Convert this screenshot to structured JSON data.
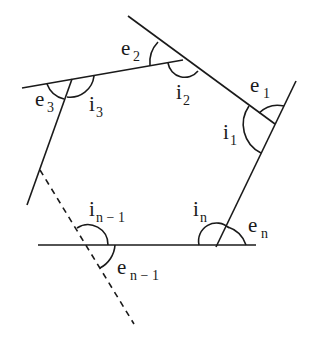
{
  "diagram": {
    "stroke_color": "#1a1a1a",
    "background": "#ffffff",
    "labels": {
      "e1": {
        "base": "e",
        "sub": "1"
      },
      "e2": {
        "base": "e",
        "sub": "2"
      },
      "e3": {
        "base": "e",
        "sub": "3"
      },
      "en": {
        "base": "e",
        "sub": "n"
      },
      "en1": {
        "base": "e",
        "sub": "n − 1"
      },
      "i1": {
        "base": "i",
        "sub": "1"
      },
      "i2": {
        "base": "i",
        "sub": "2"
      },
      "i3": {
        "base": "i",
        "sub": "3"
      },
      "in": {
        "base": "i",
        "sub": "n"
      },
      "in1": {
        "base": "i",
        "sub": "n − 1"
      }
    },
    "vertices": [
      {
        "name": "V1",
        "x": 275,
        "y": 124
      },
      {
        "name": "V2",
        "x": 183,
        "y": 60
      },
      {
        "name": "V3",
        "x": 70,
        "y": 80
      },
      {
        "name": "Vn-1",
        "x": 87,
        "y": 245
      },
      {
        "name": "Vn",
        "x": 218,
        "y": 245
      }
    ]
  }
}
